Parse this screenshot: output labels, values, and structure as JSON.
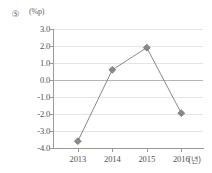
{
  "item_number": "⑤",
  "chart_data": {
    "type": "line",
    "title": "",
    "xlabel": "(년)",
    "ylabel": "(%p)",
    "categories": [
      "2013",
      "2014",
      "2015",
      "2016"
    ],
    "series": [
      {
        "name": "series-1",
        "values": [
          -3.6,
          0.6,
          1.9,
          -1.95
        ]
      }
    ],
    "ylim": [
      -4.0,
      3.0
    ],
    "yticks": [
      "3.0",
      "2.0",
      "1.0",
      "0.0",
      "-1.0",
      "-2.0",
      "-3.0",
      "-4.0"
    ],
    "ytick_values": [
      3.0,
      2.0,
      1.0,
      0.0,
      -1.0,
      -2.0,
      -3.0,
      -4.0
    ],
    "grid": true,
    "legend": "none",
    "marker": "diamond",
    "line_color": "#7a7a7a",
    "marker_color": "#8a8a8a",
    "grid_color": "#e4e4e4",
    "zero_line_color": "#b6b6b6"
  }
}
